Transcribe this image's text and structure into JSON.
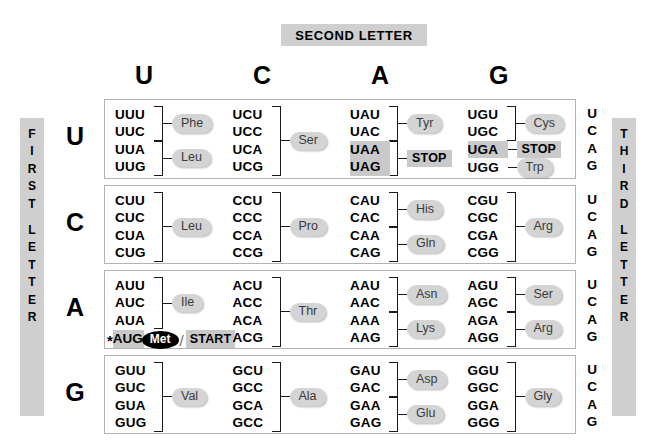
{
  "banners": {
    "second_letter": "SECOND LETTER",
    "first_letter_chars": [
      "F",
      "I",
      "R",
      "S",
      "T",
      "",
      "L",
      "E",
      "T",
      "T",
      "E",
      "R"
    ],
    "third_letter_chars": [
      "T",
      "H",
      "I",
      "R",
      "D",
      "",
      "L",
      "E",
      "T",
      "T",
      "E",
      "R"
    ]
  },
  "colors": {
    "banner_gray": "#cfcfcf",
    "pill_gray": "#d4d4d4",
    "highlight_gray": "#c9c9c9",
    "border_gray": "#b3b3b3",
    "met_black": "#000000",
    "text_black": "#000000"
  },
  "column_headers": [
    "U",
    "C",
    "A",
    "G"
  ],
  "row_headers": [
    "U",
    "C",
    "A",
    "G"
  ],
  "third_letters": [
    "U",
    "C",
    "A",
    "G"
  ],
  "notes": {
    "start_marker": "*",
    "start_label": "START",
    "slash": "/"
  },
  "table": [
    {
      "first_letter": "U",
      "columns": [
        {
          "second_letter": "U",
          "groups": [
            {
              "codons": [
                "UUU",
                "UUC"
              ],
              "aa": "Phe",
              "style": "pill",
              "highlight": false
            },
            {
              "codons": [
                "UUA",
                "UUG"
              ],
              "aa": "Leu",
              "style": "pill",
              "highlight": false
            }
          ]
        },
        {
          "second_letter": "C",
          "groups": [
            {
              "codons": [
                "UCU",
                "UCC",
                "UCA",
                "UCG"
              ],
              "aa": "Ser",
              "style": "pill",
              "highlight": false
            }
          ]
        },
        {
          "second_letter": "A",
          "groups": [
            {
              "codons": [
                "UAU",
                "UAC"
              ],
              "aa": "Tyr",
              "style": "pill",
              "highlight": false
            },
            {
              "codons": [
                "UAA",
                "UAG"
              ],
              "aa": "STOP",
              "style": "stop",
              "highlight": true
            }
          ]
        },
        {
          "second_letter": "G",
          "groups": [
            {
              "codons": [
                "UGU",
                "UGC"
              ],
              "aa": "Cys",
              "style": "pill",
              "highlight": false
            },
            {
              "codons": [
                "UGA"
              ],
              "aa": "STOP",
              "style": "stop",
              "highlight": true
            },
            {
              "codons": [
                "UGG"
              ],
              "aa": "Trp",
              "style": "pill",
              "highlight": false
            }
          ]
        }
      ]
    },
    {
      "first_letter": "C",
      "columns": [
        {
          "second_letter": "U",
          "groups": [
            {
              "codons": [
                "CUU",
                "CUC",
                "CUA",
                "CUG"
              ],
              "aa": "Leu",
              "style": "pill",
              "highlight": false
            }
          ]
        },
        {
          "second_letter": "C",
          "groups": [
            {
              "codons": [
                "CCU",
                "CCC",
                "CCA",
                "CCG"
              ],
              "aa": "Pro",
              "style": "pill",
              "highlight": false
            }
          ]
        },
        {
          "second_letter": "A",
          "groups": [
            {
              "codons": [
                "CAU",
                "CAC"
              ],
              "aa": "His",
              "style": "pill",
              "highlight": false
            },
            {
              "codons": [
                "CAA",
                "CAG"
              ],
              "aa": "Gln",
              "style": "pill",
              "highlight": false
            }
          ]
        },
        {
          "second_letter": "G",
          "groups": [
            {
              "codons": [
                "CGU",
                "CGC",
                "CGA",
                "CGG"
              ],
              "aa": "Arg",
              "style": "pill",
              "highlight": false
            }
          ]
        }
      ]
    },
    {
      "first_letter": "A",
      "columns": [
        {
          "second_letter": "U",
          "groups": [
            {
              "codons": [
                "AUU",
                "AUC",
                "AUA"
              ],
              "aa": "Ile",
              "style": "pill",
              "highlight": false
            },
            {
              "codons": [
                "AUG"
              ],
              "aa": "Met",
              "style": "met",
              "highlight": true,
              "start": true
            }
          ]
        },
        {
          "second_letter": "C",
          "groups": [
            {
              "codons": [
                "ACU",
                "ACC",
                "ACA",
                "ACG"
              ],
              "aa": "Thr",
              "style": "pill",
              "highlight": false
            }
          ]
        },
        {
          "second_letter": "A",
          "groups": [
            {
              "codons": [
                "AAU",
                "AAC"
              ],
              "aa": "Asn",
              "style": "pill",
              "highlight": false
            },
            {
              "codons": [
                "AAA",
                "AAG"
              ],
              "aa": "Lys",
              "style": "pill",
              "highlight": false
            }
          ]
        },
        {
          "second_letter": "G",
          "groups": [
            {
              "codons": [
                "AGU",
                "AGC"
              ],
              "aa": "Ser",
              "style": "pill",
              "highlight": false
            },
            {
              "codons": [
                "AGA",
                "AGG"
              ],
              "aa": "Arg",
              "style": "pill",
              "highlight": false
            }
          ]
        }
      ]
    },
    {
      "first_letter": "G",
      "columns": [
        {
          "second_letter": "U",
          "groups": [
            {
              "codons": [
                "GUU",
                "GUC",
                "GUA",
                "GUG"
              ],
              "aa": "Val",
              "style": "pill",
              "highlight": false
            }
          ]
        },
        {
          "second_letter": "C",
          "groups": [
            {
              "codons": [
                "GCU",
                "GCC",
                "GCA",
                "GCC"
              ],
              "aa": "Ala",
              "style": "pill",
              "highlight": false
            }
          ]
        },
        {
          "second_letter": "A",
          "groups": [
            {
              "codons": [
                "GAU",
                "GAC"
              ],
              "aa": "Asp",
              "style": "pill",
              "highlight": false
            },
            {
              "codons": [
                "GAA",
                "GAG"
              ],
              "aa": "Glu",
              "style": "pill",
              "highlight": false
            }
          ]
        },
        {
          "second_letter": "G",
          "groups": [
            {
              "codons": [
                "GGU",
                "GGC",
                "GGA",
                "GGG"
              ],
              "aa": "Gly",
              "style": "pill",
              "highlight": false
            }
          ]
        }
      ]
    }
  ]
}
